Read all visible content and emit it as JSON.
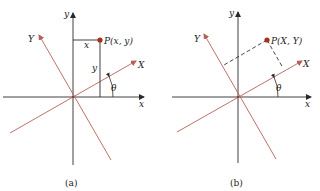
{
  "colors": {
    "axis": "#2a2a2a",
    "rotated_axis": "#b5605a",
    "point": "#a0321e",
    "dashed": "#333333"
  },
  "panel_a": {
    "caption": "(a)",
    "x_axis_label": "x",
    "y_axis_label": "y",
    "X_axis_label": "X",
    "Y_axis_label": "Y",
    "point_label": "P(x, y)",
    "horizontal_segment_label": "x",
    "vertical_segment_label": "y",
    "angle_label": "θ"
  },
  "panel_b": {
    "caption": "(b)",
    "x_axis_label": "x",
    "y_axis_label": "y",
    "X_axis_label": "X",
    "Y_axis_label": "Y",
    "point_label": "P(X, Y)",
    "angle_label": "θ"
  }
}
